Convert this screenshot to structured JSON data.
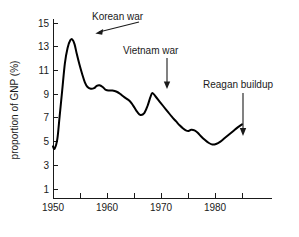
{
  "chart_data": {
    "type": "line",
    "title": "",
    "xlabel": "",
    "ylabel": "proportion of GNP (%)",
    "xlim": [
      1948.5,
      1985.5
    ],
    "ylim": [
      0,
      15.8
    ],
    "grid": false,
    "legend": "none",
    "x_ticks": [
      1950,
      1955,
      1960,
      1965,
      1970,
      1975,
      1980,
      1985
    ],
    "x_tick_labels": [
      "1950",
      "",
      "1960",
      "",
      "1970",
      "",
      "1980",
      ""
    ],
    "y_ticks": [
      1,
      3,
      5,
      7,
      9,
      11,
      13,
      15
    ],
    "y_tick_labels": [
      "1",
      "3",
      "5",
      "7",
      "9",
      "11",
      "13",
      "15"
    ],
    "series": [
      {
        "name": "defense spending share of GNP",
        "x": [
          1950.0,
          1950.3,
          1950.8,
          1951.2,
          1951.7,
          1952.2,
          1952.7,
          1953.2,
          1953.6,
          1954.0,
          1954.4,
          1954.9,
          1955.4,
          1955.9,
          1956.4,
          1957.0,
          1957.6,
          1958.1,
          1958.6,
          1959.2,
          1959.8,
          1960.4,
          1961.0,
          1961.8,
          1962.5,
          1963.2,
          1964.0,
          1964.6,
          1965.1,
          1965.6,
          1966.2,
          1966.9,
          1967.5,
          1968.0,
          1968.4,
          1969.0,
          1969.7,
          1970.4,
          1971.2,
          1972.0,
          1972.8,
          1973.5,
          1974.1,
          1974.6,
          1975.1,
          1975.6,
          1976.2,
          1976.8,
          1977.4,
          1978.1,
          1978.8,
          1979.5,
          1980.2,
          1981.0,
          1981.8,
          1982.6,
          1983.4,
          1984.2,
          1985.0
        ],
        "y": [
          4.6,
          4.4,
          5.2,
          7.0,
          9.3,
          11.6,
          12.9,
          13.55,
          13.6,
          13.2,
          12.4,
          11.5,
          10.7,
          10.0,
          9.6,
          9.45,
          9.5,
          9.7,
          9.75,
          9.6,
          9.35,
          9.3,
          9.3,
          9.2,
          9.0,
          8.75,
          8.5,
          8.2,
          7.85,
          7.5,
          7.25,
          7.4,
          8.0,
          8.7,
          9.1,
          8.8,
          8.4,
          8.0,
          7.55,
          7.1,
          6.7,
          6.35,
          6.1,
          5.95,
          5.9,
          6.0,
          5.95,
          5.75,
          5.45,
          5.15,
          4.9,
          4.75,
          4.8,
          5.0,
          5.3,
          5.6,
          5.9,
          6.2,
          6.45
        ]
      }
    ],
    "annotations": [
      {
        "id": "korean-war",
        "label": "Korean war",
        "label_x": 92,
        "label_y": 20,
        "arrow_from_x": 139,
        "arrow_from_y": 22,
        "arrow_to_x": 96,
        "arrow_to_y": 34,
        "points_to_year": 1953.5,
        "points_to_value": 13.6
      },
      {
        "id": "vietnam-war",
        "label": "Vietnam war",
        "label_x": 123,
        "label_y": 54,
        "arrow_from_x": 167,
        "arrow_from_y": 58,
        "arrow_to_x": 167,
        "arrow_to_y": 87,
        "points_to_year": 1968.4,
        "points_to_value": 9.1
      },
      {
        "id": "reagan-buildup",
        "label": "Reagan buildup",
        "label_x": 203,
        "label_y": 88,
        "arrow_from_x": 243,
        "arrow_from_y": 93,
        "arrow_to_x": 243,
        "arrow_to_y": 134,
        "points_to_year": 1983.0,
        "points_to_value": 5.75
      }
    ]
  }
}
